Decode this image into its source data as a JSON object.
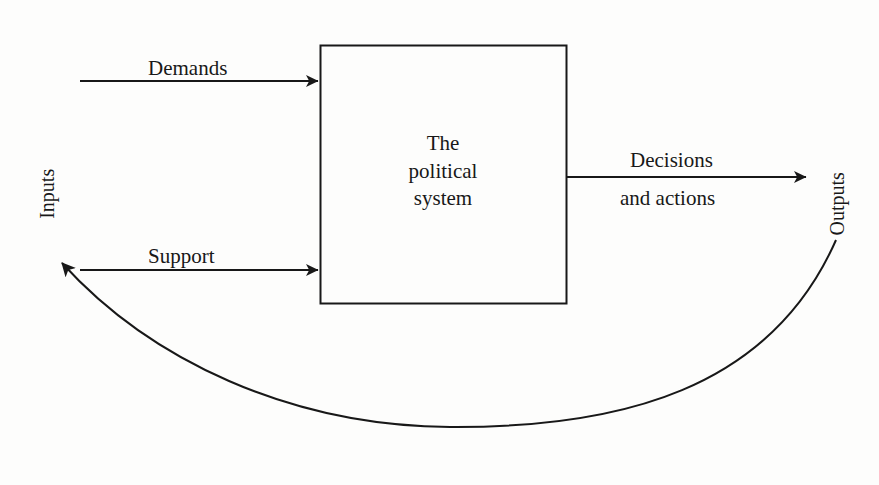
{
  "diagram": {
    "type": "systems-flow-diagram",
    "colors": {
      "background": "#fdfdfc",
      "stroke": "#181818",
      "text": "#181818"
    },
    "center_box": {
      "label_lines": [
        "The",
        "political",
        "system"
      ],
      "line1": "The",
      "line2": "political",
      "line3": "system"
    },
    "inputs": {
      "axis_label": "Inputs",
      "arrows": [
        {
          "label": "Demands"
        },
        {
          "label": "Support"
        }
      ]
    },
    "outputs": {
      "axis_label": "Outputs",
      "arrows": [
        {
          "label_top": "Decisions",
          "label_bottom": "and actions"
        }
      ]
    },
    "feedback": {
      "label": "",
      "description": "feedback-loop-curve"
    }
  }
}
